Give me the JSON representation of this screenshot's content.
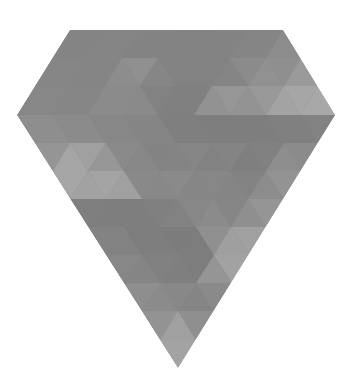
{
  "image": {
    "subject": "faceted-gem-diamond",
    "background": "#ffffff",
    "outline": {
      "top_left": [
        70,
        30
      ],
      "top_right": [
        283,
        30
      ],
      "right_point": [
        335,
        115
      ],
      "bottom_tip": [
        178,
        368
      ],
      "left_point": [
        17,
        115
      ]
    },
    "palette": {
      "dark": "#7d7d7d",
      "mid_dark": "#848484",
      "mid": "#8c8c8c",
      "mid_light": "#969696",
      "light": "#a3a3a3",
      "lighter": "#adadad"
    }
  }
}
